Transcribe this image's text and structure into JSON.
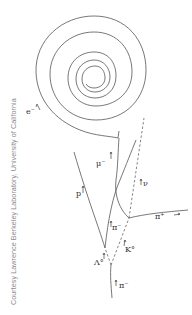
{
  "credit": "Courtesy Lawrence Berkeley Laboratory, University of California",
  "particles": {
    "electron": "e⁻",
    "muon": "μ⁻",
    "proton": "p",
    "neutrino": "ν",
    "pion_minus_mid": "π⁻",
    "pion_plus": "π⁺",
    "kaon0": "K°",
    "lambda0": "Λ°",
    "pion_minus_incoming": "π⁻"
  }
}
